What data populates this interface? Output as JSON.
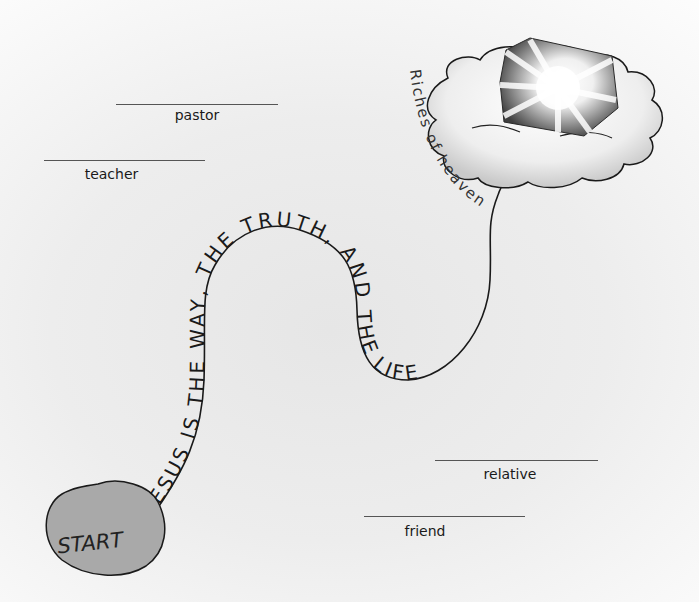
{
  "illustration": {
    "path_caption": "JESUS IS THE WAY, THE TRUTH, AND THE LIFE",
    "goal_caption": "Riches of heaven",
    "start_label": "START"
  },
  "blanks": [
    {
      "id": "pastor",
      "label": "pastor"
    },
    {
      "id": "teacher",
      "label": "teacher"
    },
    {
      "id": "relative",
      "label": "relative"
    },
    {
      "id": "friend",
      "label": "friend"
    }
  ],
  "colors": {
    "start_fill": "#a9a9a9",
    "ink": "#1a1a1a",
    "cloud_fill": "#f4f4f4",
    "chest_dark": "#4a4a4a"
  }
}
